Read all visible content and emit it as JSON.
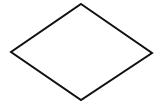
{
  "diagram": {
    "background": "#ffffff",
    "shapes": [
      {
        "type": "diamond",
        "role": "decision",
        "label": "",
        "points": [
          [
            81,
            4
          ],
          [
            152,
            53
          ],
          [
            81,
            100
          ],
          [
            11,
            52
          ]
        ],
        "stroke": "#111111",
        "stroke_width": 2,
        "fill": "#ffffff"
      }
    ]
  }
}
